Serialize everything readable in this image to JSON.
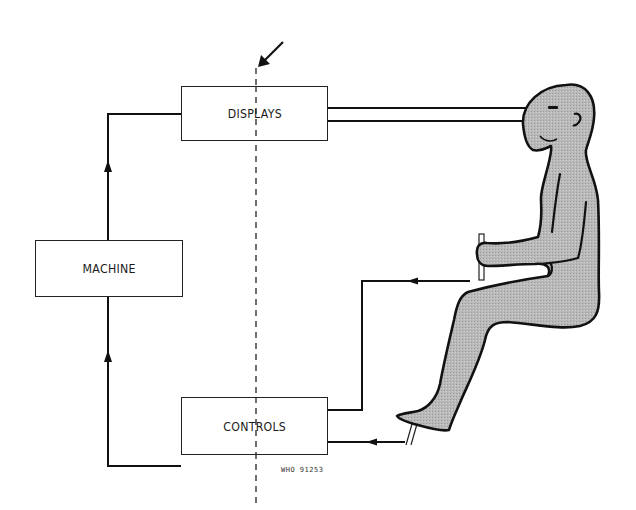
{
  "diagram": {
    "title": "",
    "type": "human-machine control loop",
    "blocks": [
      {
        "id": "displays",
        "label": "DISPLAYS"
      },
      {
        "id": "machine",
        "label": "MACHINE"
      },
      {
        "id": "controls",
        "label": "CONTROLS"
      }
    ],
    "connections": [
      {
        "from": "machine",
        "to": "displays",
        "direction": "up"
      },
      {
        "from": "controls",
        "to": "machine",
        "direction": "up"
      },
      {
        "from": "displays",
        "to": "operator-eyes",
        "count": 2
      },
      {
        "from": "operator-hand",
        "to": "controls"
      },
      {
        "from": "operator-foot",
        "to": "controls"
      }
    ],
    "interface_boundary": {
      "style": "dashed",
      "marker": "diagonal-arrow"
    },
    "operator": {
      "figure": "seated-human",
      "holds": "joystick",
      "foot_on": "pedal"
    },
    "figure_id": "WHO 91253"
  },
  "colors": {
    "line": "#111111",
    "body_fill": "#b8b8b8",
    "box_border": "#222222",
    "background": "#ffffff"
  }
}
